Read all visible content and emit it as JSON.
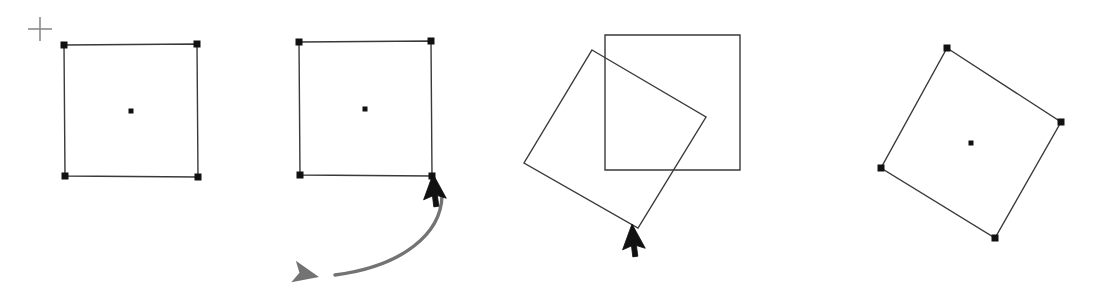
{
  "canvas": {
    "width": 1101,
    "height": 295,
    "background": "#ffffff",
    "title": "Square rotation sequence"
  },
  "style": {
    "shape_stroke": "#3a3a3a",
    "shape_stroke_width": 1.4,
    "shape_fill": "none",
    "handle_color": "#111111",
    "handle_size": 7,
    "center_handle_size": 5,
    "cursor_color": "#111111",
    "rotation_arrow_color": "#737373",
    "rotation_arrow_width": 3.4,
    "crosshair_color": "#8a8a8a",
    "crosshair_width": 1.6
  },
  "panels": [
    {
      "id": "panel-1",
      "name": "selected-square-initial",
      "label": "Square selected, unrotated",
      "square": {
        "name": "square-initial",
        "points": [
          [
            64,
            45
          ],
          [
            197,
            44
          ],
          [
            198,
            177
          ],
          [
            65,
            176
          ]
        ],
        "rotation_deg": 0
      },
      "handles": {
        "corners": [
          [
            64,
            45
          ],
          [
            197,
            44
          ],
          [
            198,
            177
          ],
          [
            65,
            176
          ]
        ],
        "center": [
          131,
          111
        ]
      },
      "crosshair": {
        "name": "crosshair-cursor",
        "x": 40,
        "y": 29,
        "arm": 12
      }
    },
    {
      "id": "panel-2",
      "name": "square-with-rotate-cursor",
      "label": "Rotation handle grabbed",
      "square": {
        "name": "square-before-rotation",
        "points": [
          [
            299,
            42
          ],
          [
            431,
            41
          ],
          [
            432,
            176
          ],
          [
            300,
            175
          ]
        ],
        "rotation_deg": 0
      },
      "handles": {
        "corners": [
          [
            299,
            42
          ],
          [
            431,
            41
          ],
          [
            432,
            176
          ],
          [
            300,
            175
          ]
        ],
        "center": [
          365,
          109
        ]
      },
      "cursor": {
        "name": "mouse-pointer-arrow",
        "x": 433,
        "y": 174,
        "angle_deg": 20
      },
      "rotation_arrow": {
        "name": "rotation-direction-arrow",
        "path": "M 442,196 C 441,233 404,266 335,275",
        "arrow_tip": [
          319,
          277
        ],
        "arrow_angle_deg": 192,
        "direction": "counterclockwise"
      }
    },
    {
      "id": "panel-3",
      "name": "square-mid-rotation",
      "label": "Square being rotated, original outline shown",
      "ghost_square": {
        "name": "square-original-outline",
        "points": [
          [
            605,
            35
          ],
          [
            740,
            35
          ],
          [
            740,
            170
          ],
          [
            605,
            170
          ]
        ],
        "rotation_deg": 0
      },
      "rotating_square": {
        "name": "square-rotating",
        "points": [
          [
            592,
            50
          ],
          [
            706,
            117
          ],
          [
            638,
            228
          ],
          [
            524,
            163
          ]
        ],
        "rotation_deg": 30
      },
      "cursor": {
        "name": "mouse-pointer-arrow",
        "x": 632,
        "y": 224,
        "angle_deg": 20
      }
    },
    {
      "id": "panel-4",
      "name": "square-rotated-final",
      "label": "Square after rotation, selected",
      "square": {
        "name": "square-rotated",
        "points": [
          [
            947,
            48
          ],
          [
            1061,
            122
          ],
          [
            995,
            238
          ],
          [
            881,
            168
          ]
        ],
        "rotation_deg": 33
      },
      "handles": {
        "corners": [
          [
            947,
            48
          ],
          [
            1061,
            122
          ],
          [
            995,
            238
          ],
          [
            881,
            168
          ]
        ],
        "center": [
          971,
          143
        ]
      }
    }
  ]
}
